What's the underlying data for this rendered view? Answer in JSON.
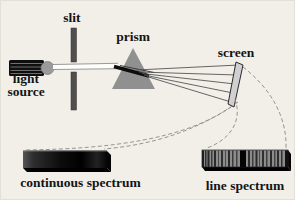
{
  "diagram": {
    "type": "physics-optics-spectroscopy-diagram",
    "labels": {
      "slit": "slit",
      "prism": "prism",
      "screen": "screen",
      "light_source_line1": "light",
      "light_source_line2": "source",
      "continuous_spectrum": "continuous spectrum",
      "line_spectrum": "line spectrum"
    },
    "colors": {
      "paper": "#f2efe9",
      "ink": "#141414",
      "slit_fill": "#4f4f4f",
      "prism_fill": "#909090",
      "prism_edge": "#6e6e6e",
      "bulb_fill": "#9a9a9a",
      "lamp_body": "#0f0f0f",
      "screen_fill": "#d0d0d0",
      "ray_stroke": "#555555",
      "dashed_stroke": "#8a8a8a",
      "line_spectrum_base": "#8c8c8c"
    },
    "line_spectrum_stripes": [
      {
        "x": 0,
        "w": 2,
        "c": "#1c1c1c"
      },
      {
        "x": 3,
        "w": 1.5,
        "c": "#2e2e2e"
      },
      {
        "x": 5.5,
        "w": 2,
        "c": "#262626"
      },
      {
        "x": 9,
        "w": 1.5,
        "c": "#3a3a3a"
      },
      {
        "x": 12,
        "w": 2,
        "c": "#2b2b2b"
      },
      {
        "x": 16,
        "w": 1,
        "c": "#4a4a4a"
      },
      {
        "x": 19,
        "w": 2,
        "c": "#303030"
      },
      {
        "x": 23,
        "w": 1,
        "c": "#4a4a4a"
      },
      {
        "x": 26,
        "w": 2,
        "c": "#2b2b2b"
      },
      {
        "x": 30,
        "w": 1.5,
        "c": "#3a3a3a"
      },
      {
        "x": 34,
        "w": 1.5,
        "c": "#444444"
      },
      {
        "x": 38,
        "w": 6,
        "c": "#050505"
      },
      {
        "x": 46,
        "w": 2,
        "c": "#2e2e2e"
      },
      {
        "x": 50,
        "w": 1.5,
        "c": "#3c3c3c"
      },
      {
        "x": 53.5,
        "w": 2,
        "c": "#2b2b2b"
      },
      {
        "x": 57,
        "w": 1,
        "c": "#4a4a4a"
      },
      {
        "x": 60,
        "w": 2,
        "c": "#303030"
      },
      {
        "x": 64,
        "w": 1.5,
        "c": "#3e3e3e"
      },
      {
        "x": 68,
        "w": 2,
        "c": "#2b2b2b"
      },
      {
        "x": 72,
        "w": 1.5,
        "c": "#444444"
      },
      {
        "x": 75,
        "w": 2,
        "c": "#2e2e2e"
      },
      {
        "x": 79,
        "w": 1.5,
        "c": "#333333"
      },
      {
        "x": 83,
        "w": 3,
        "c": "#111111"
      }
    ]
  }
}
